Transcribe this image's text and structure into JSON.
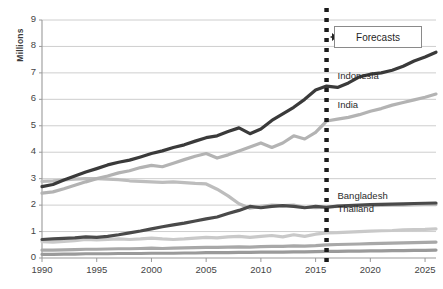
{
  "chart_data": {
    "type": "line",
    "title": "",
    "xlabel": "",
    "ylabel": "Millions",
    "xlim": [
      1990,
      2026
    ],
    "ylim": [
      0,
      9
    ],
    "grid": true,
    "legend_position": "inline-labels",
    "xticks": [
      "1990",
      "1995",
      "2000",
      "2005",
      "2010",
      "2015",
      "2020",
      "2025"
    ],
    "yticks": [
      "0",
      "1",
      "2",
      "3",
      "4",
      "5",
      "6",
      "7",
      "8",
      "9"
    ],
    "annotations": [
      {
        "name": "forecast-divider",
        "label": "Forecasts",
        "x": 2016,
        "style": "dotted-vertical-line"
      }
    ],
    "x": [
      1990,
      1991,
      1992,
      1993,
      1994,
      1995,
      1996,
      1997,
      1998,
      1999,
      2000,
      2001,
      2002,
      2003,
      2004,
      2005,
      2006,
      2007,
      2008,
      2009,
      2010,
      2011,
      2012,
      2013,
      2014,
      2015,
      2016,
      2017,
      2018,
      2019,
      2020,
      2021,
      2022,
      2023,
      2024,
      2025,
      2026
    ],
    "series": [
      {
        "name": "Indonesia",
        "color": "#3a3a3a",
        "label_x": 2017,
        "label_y": 6.85,
        "values": [
          2.7,
          2.78,
          2.95,
          3.1,
          3.25,
          3.38,
          3.52,
          3.62,
          3.7,
          3.82,
          3.95,
          4.05,
          4.18,
          4.28,
          4.42,
          4.55,
          4.62,
          4.78,
          4.92,
          4.7,
          4.88,
          5.2,
          5.45,
          5.7,
          6.0,
          6.35,
          6.5,
          6.45,
          6.62,
          6.85,
          6.95,
          7.0,
          7.1,
          7.25,
          7.45,
          7.6,
          7.78
        ]
      },
      {
        "name": "India",
        "color": "#b3b3b3",
        "label_x": 2017,
        "label_y": 5.75,
        "values": [
          2.45,
          2.5,
          2.62,
          2.75,
          2.88,
          3.0,
          3.1,
          3.22,
          3.3,
          3.42,
          3.5,
          3.45,
          3.58,
          3.72,
          3.85,
          3.95,
          3.78,
          3.9,
          4.05,
          4.2,
          4.35,
          4.18,
          4.35,
          4.62,
          4.5,
          4.75,
          5.18,
          5.25,
          5.32,
          5.42,
          5.55,
          5.65,
          5.78,
          5.88,
          5.98,
          6.08,
          6.2
        ]
      },
      {
        "name": "Thailand",
        "color": "#bdbdbd",
        "label_x": 2017,
        "label_y": 1.8,
        "values": [
          2.9,
          2.92,
          2.95,
          2.98,
          3.0,
          3.0,
          2.98,
          2.96,
          2.92,
          2.9,
          2.88,
          2.86,
          2.88,
          2.85,
          2.82,
          2.8,
          2.6,
          2.35,
          2.05,
          1.88,
          1.95,
          2.0,
          1.98,
          2.0,
          1.92,
          1.9,
          1.92,
          1.95,
          1.96,
          1.98,
          1.98,
          1.99,
          2.0,
          2.0,
          2.01,
          2.02,
          2.02
        ]
      },
      {
        "name": "Bangladesh",
        "color": "#4a4a4a",
        "label_x": 2017,
        "label_y": 2.3,
        "values": [
          0.7,
          0.72,
          0.74,
          0.76,
          0.8,
          0.78,
          0.82,
          0.88,
          0.95,
          1.02,
          1.1,
          1.18,
          1.25,
          1.32,
          1.4,
          1.48,
          1.55,
          1.68,
          1.8,
          1.95,
          1.9,
          1.95,
          1.98,
          1.95,
          1.9,
          1.95,
          1.92,
          1.96,
          1.98,
          2.0,
          2.02,
          2.03,
          2.04,
          2.05,
          2.06,
          2.07,
          2.08
        ]
      },
      {
        "name": "low-series-a",
        "color": "#c9c9c9",
        "label_x": null,
        "label_y": null,
        "values": [
          0.62,
          0.6,
          0.63,
          0.66,
          0.7,
          0.68,
          0.7,
          0.72,
          0.7,
          0.72,
          0.75,
          0.72,
          0.7,
          0.72,
          0.75,
          0.78,
          0.76,
          0.8,
          0.82,
          0.78,
          0.82,
          0.85,
          0.8,
          0.88,
          0.82,
          0.9,
          0.95,
          0.96,
          0.98,
          1.0,
          1.02,
          1.03,
          1.04,
          1.06,
          1.07,
          1.08,
          1.1
        ]
      },
      {
        "name": "low-series-b",
        "color": "#a8a8a8",
        "label_x": null,
        "label_y": null,
        "values": [
          0.3,
          0.3,
          0.31,
          0.32,
          0.33,
          0.33,
          0.34,
          0.35,
          0.35,
          0.36,
          0.37,
          0.36,
          0.37,
          0.38,
          0.39,
          0.4,
          0.4,
          0.41,
          0.42,
          0.41,
          0.43,
          0.44,
          0.44,
          0.46,
          0.45,
          0.47,
          0.5,
          0.51,
          0.52,
          0.53,
          0.54,
          0.55,
          0.56,
          0.57,
          0.58,
          0.59,
          0.6
        ]
      },
      {
        "name": "low-series-c",
        "color": "#9a9a9a",
        "label_x": null,
        "label_y": null,
        "values": [
          0.14,
          0.14,
          0.15,
          0.15,
          0.16,
          0.16,
          0.16,
          0.17,
          0.17,
          0.17,
          0.18,
          0.18,
          0.18,
          0.19,
          0.19,
          0.2,
          0.2,
          0.2,
          0.21,
          0.21,
          0.22,
          0.22,
          0.22,
          0.23,
          0.23,
          0.24,
          0.25,
          0.25,
          0.26,
          0.26,
          0.27,
          0.27,
          0.28,
          0.28,
          0.29,
          0.29,
          0.3
        ]
      }
    ]
  },
  "colors": {
    "gridline": "#c8c8c8",
    "axis": "#9a9a9a",
    "text": "#3b3b3b",
    "forecast_line": "#1a1a1a"
  }
}
